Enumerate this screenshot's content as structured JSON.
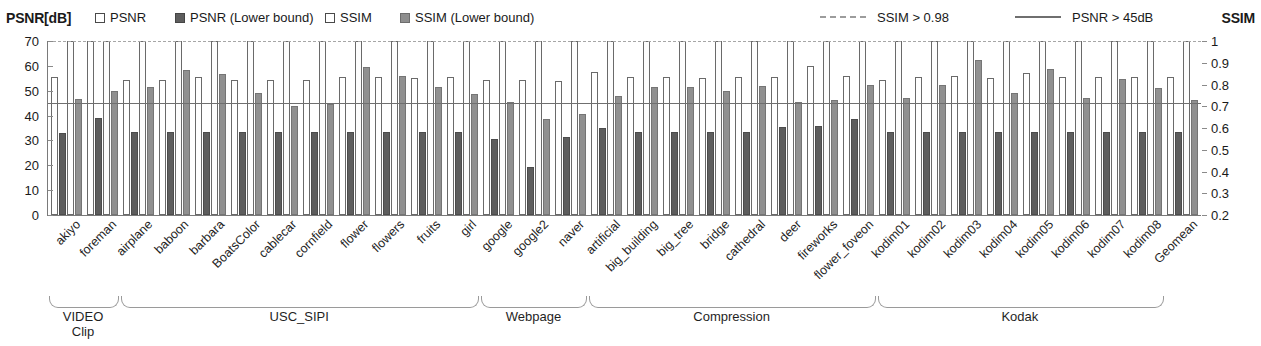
{
  "legend": {
    "left_axis_title": "PSNR[dB]",
    "right_axis_title": "SSIM",
    "items": [
      {
        "label": "PSNR",
        "style": "open-square"
      },
      {
        "label": "PSNR (Lower bound)",
        "style": "dark-square"
      },
      {
        "label": "SSIM",
        "style": "open-square"
      },
      {
        "label": "SSIM (Lower bound)",
        "style": "mid-square"
      }
    ],
    "threshold_items": [
      {
        "label": "SSIM > 0.98",
        "style": "dashed-line",
        "color": "#a6a6a6"
      },
      {
        "label": "PSNR > 45dB",
        "style": "solid-line",
        "color": "#6f6f6f"
      }
    ]
  },
  "chart_data": {
    "type": "bar",
    "title": "",
    "xlabel": "",
    "ylabel": "PSNR[dB]",
    "ylabel_right": "SSIM",
    "ylim": [
      0,
      70
    ],
    "ylim_right": [
      0.2,
      1.0
    ],
    "yticks": [
      0,
      10,
      20,
      30,
      40,
      50,
      60,
      70
    ],
    "yticks_right": [
      0.2,
      0.3,
      0.4,
      0.5,
      0.6,
      0.7,
      0.8,
      0.9,
      1
    ],
    "grid": false,
    "legend_position": "top",
    "thresholds": [
      {
        "name": "SSIM > 0.98",
        "axis": "right",
        "value": 0.98,
        "plot_y": 70,
        "style": "dashed"
      },
      {
        "name": "PSNR > 45dB",
        "axis": "left",
        "value": 45,
        "plot_y": 45,
        "style": "solid"
      }
    ],
    "categories": [
      "akiyo",
      "foreman",
      "airplane",
      "baboon",
      "barbara",
      "BoatsColor",
      "cablecar",
      "cornfield",
      "flower",
      "flowers",
      "fruits",
      "girl",
      "google",
      "google2",
      "naver",
      "artificial",
      "big_building",
      "big_tree",
      "bridge",
      "cathedral",
      "deer",
      "fireworks",
      "flower_foveon",
      "kodim01",
      "kodim02",
      "kodim03",
      "kodim04",
      "kodim05",
      "kodim06",
      "kodim07",
      "kodim08",
      "Geomean"
    ],
    "series": [
      {
        "name": "PSNR",
        "axis": "left",
        "unit": "dB",
        "values": [
          55.5,
          70.0,
          54.5,
          54.5,
          55.5,
          54.5,
          54.5,
          54.5,
          55.5,
          55.5,
          55.0,
          55.5,
          54.5,
          54.5,
          54.0,
          57.5,
          55.5,
          55.5,
          55.0,
          55.5,
          55.5,
          60.0,
          56.0,
          54.5,
          55.5,
          56.0,
          55.0,
          57.0,
          55.5,
          55.5,
          55.5,
          55.5
        ]
      },
      {
        "name": "PSNR (Lower bound)",
        "axis": "left",
        "unit": "dB",
        "values": [
          33.0,
          39.0,
          33.5,
          33.5,
          33.5,
          33.5,
          33.5,
          33.5,
          33.5,
          33.5,
          33.5,
          33.5,
          30.5,
          19.5,
          31.5,
          35.0,
          33.5,
          33.5,
          33.5,
          33.5,
          35.5,
          36.0,
          38.5,
          33.5,
          33.5,
          33.5,
          33.5,
          33.5,
          33.5,
          33.5,
          33.5,
          33.5
        ]
      },
      {
        "name": "SSIM",
        "axis": "right",
        "values": [
          1.0,
          1.0,
          1.0,
          1.0,
          1.0,
          1.0,
          1.0,
          1.0,
          1.0,
          1.0,
          1.0,
          1.0,
          1.0,
          1.0,
          1.0,
          1.0,
          1.0,
          1.0,
          1.0,
          1.0,
          1.0,
          1.0,
          1.0,
          1.0,
          1.0,
          1.0,
          1.0,
          1.0,
          1.0,
          1.0,
          1.0,
          1.0
        ]
      },
      {
        "name": "SSIM (Lower bound)",
        "axis": "right",
        "values": [
          0.735,
          0.77,
          0.79,
          0.868,
          0.85,
          0.76,
          0.7,
          0.71,
          0.88,
          0.84,
          0.79,
          0.755,
          0.72,
          0.64,
          0.665,
          0.745,
          0.79,
          0.79,
          0.77,
          0.795,
          0.72,
          0.73,
          0.8,
          0.74,
          0.8,
          0.915,
          0.76,
          0.87,
          0.74,
          0.825,
          0.785,
          0.73
        ]
      }
    ],
    "groups": [
      {
        "name": "VIDEO Clip",
        "line1": "VIDEO",
        "line2": "Clip",
        "start": 0,
        "end": 1
      },
      {
        "name": "USC_SIPI",
        "line1": "USC_SIPI",
        "line2": "",
        "start": 2,
        "end": 11
      },
      {
        "name": "Webpage",
        "line1": "Webpage",
        "line2": "",
        "start": 12,
        "end": 14
      },
      {
        "name": "Compression",
        "line1": "Compression",
        "line2": "",
        "start": 15,
        "end": 22
      },
      {
        "name": "Kodak",
        "line1": "Kodak",
        "line2": "",
        "start": 23,
        "end": 30
      }
    ]
  }
}
